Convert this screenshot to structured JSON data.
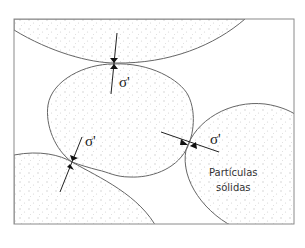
{
  "diagram": {
    "labels": {
      "sigma_top": "σ'",
      "sigma_left": "σ'",
      "sigma_right": "σ'",
      "particles_line1": "Partículas",
      "particles_line2": "sólidas"
    },
    "colors": {
      "border": "#8a8a8a",
      "outline": "#555555",
      "dots": "#cfcfcf",
      "arrow": "#111111"
    }
  }
}
